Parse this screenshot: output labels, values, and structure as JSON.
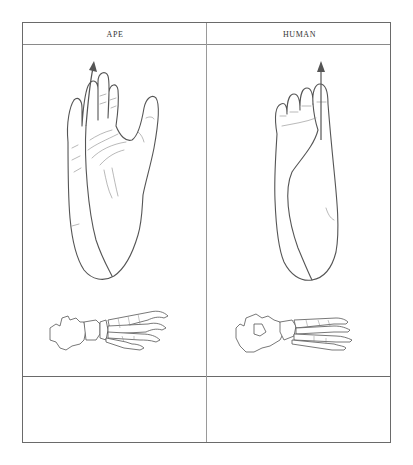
{
  "table": {
    "columns": [
      {
        "header": "APE"
      },
      {
        "header": "HUMAN"
      }
    ],
    "rows": [
      {
        "cells": [
          {
            "figures": [
              "ape-foot-sole-with-axis-arrow",
              "ape-foot-skeleton"
            ]
          },
          {
            "figures": [
              "human-foot-sole-with-axis-arrow",
              "human-foot-skeleton"
            ]
          }
        ]
      },
      {
        "cells": [
          {
            "text": ""
          },
          {
            "text": ""
          }
        ]
      }
    ]
  },
  "colors": {
    "line": "#555555",
    "grid": "#8a8a8a",
    "background": "#ffffff"
  }
}
